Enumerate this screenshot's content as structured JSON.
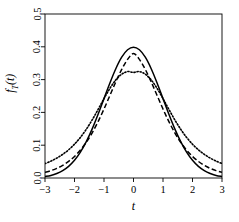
{
  "chart_data": {
    "type": "line",
    "title": "",
    "subtitle": "",
    "xlabel": "t",
    "ylabel": "f_T(t)",
    "xlim": [
      -3,
      3
    ],
    "ylim": [
      0,
      0.5
    ],
    "grid": false,
    "legend": "none",
    "box": true,
    "xticks": [
      -3,
      -2,
      -1,
      0,
      1,
      2,
      3
    ],
    "xtick_labels": [
      "-3",
      "-2",
      "-1",
      "0",
      "1",
      "2",
      "3"
    ],
    "yticks": [
      0.0,
      0.1,
      0.2,
      0.3,
      0.4,
      0.5
    ],
    "ytick_labels": [
      "0.0",
      "0.1",
      "0.2",
      "0.3",
      "0.4",
      "0.5"
    ],
    "x": [
      -3.0,
      -2.8,
      -2.6,
      -2.4,
      -2.2,
      -2.0,
      -1.8,
      -1.6,
      -1.4,
      -1.2,
      -1.0,
      -0.8,
      -0.6,
      -0.4,
      -0.2,
      0.0,
      0.2,
      0.4,
      0.6,
      0.8,
      1.0,
      1.2,
      1.4,
      1.6,
      1.8,
      2.0,
      2.2,
      2.4,
      2.6,
      2.8,
      3.0
    ],
    "series": [
      {
        "name": "solid",
        "style": "solid",
        "color": "#000000",
        "peak": 0.399,
        "values": [
          0.0044,
          0.0079,
          0.0136,
          0.0224,
          0.0355,
          0.054,
          0.079,
          0.1109,
          0.1497,
          0.1942,
          0.242,
          0.2897,
          0.3332,
          0.3683,
          0.391,
          0.3989,
          0.391,
          0.3683,
          0.3332,
          0.2897,
          0.242,
          0.1942,
          0.1497,
          0.1109,
          0.079,
          0.054,
          0.0355,
          0.0224,
          0.0136,
          0.0079,
          0.0044
        ]
      },
      {
        "name": "dashed",
        "style": "dashed",
        "color": "#000000",
        "peak": 0.3796,
        "values": [
          0.0173,
          0.0225,
          0.0294,
          0.0385,
          0.0506,
          0.0658,
          0.0851,
          0.109,
          0.1379,
          0.1719,
          0.2103,
          0.2516,
          0.293,
          0.331,
          0.3616,
          0.3796,
          0.3616,
          0.331,
          0.293,
          0.2516,
          0.2103,
          0.1719,
          0.1379,
          0.109,
          0.0851,
          0.0658,
          0.0506,
          0.0385,
          0.0294,
          0.0225,
          0.0173
        ]
      },
      {
        "name": "dotted",
        "style": "dotted",
        "color": "#000000",
        "peak": 0.322,
        "values": [
          0.044,
          0.0515,
          0.0607,
          0.072,
          0.086,
          0.1031,
          0.1238,
          0.1486,
          0.1773,
          0.2091,
          0.242,
          0.2732,
          0.299,
          0.3163,
          0.3245,
          0.322,
          0.3245,
          0.3163,
          0.299,
          0.2732,
          0.242,
          0.2091,
          0.1773,
          0.1486,
          0.1238,
          0.1031,
          0.086,
          0.072,
          0.0607,
          0.0515,
          0.044
        ]
      }
    ]
  }
}
